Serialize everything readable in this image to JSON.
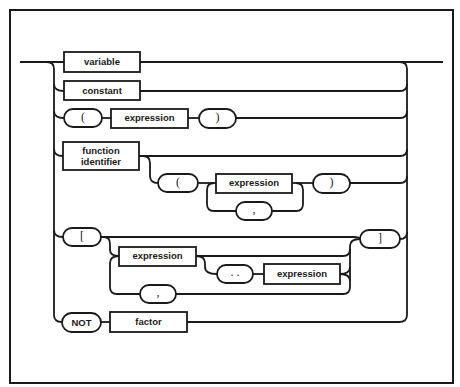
{
  "diagram": {
    "title": "factor",
    "type": "syntax-railroad-diagram",
    "colors": {
      "line": "#1a1a1a",
      "background": "#ffffff"
    },
    "nodes": {
      "variable": {
        "kind": "nonterminal",
        "label": "variable"
      },
      "constant": {
        "kind": "nonterminal",
        "label": "constant"
      },
      "lparen1": {
        "kind": "terminal",
        "label": "("
      },
      "expression1": {
        "kind": "nonterminal",
        "label": "expression"
      },
      "rparen1": {
        "kind": "terminal",
        "label": ")"
      },
      "function_identifier": {
        "kind": "nonterminal",
        "label_line1": "function",
        "label_line2": "identifier"
      },
      "lparen2": {
        "kind": "terminal",
        "label": "("
      },
      "expression2": {
        "kind": "nonterminal",
        "label": "expression"
      },
      "comma1": {
        "kind": "terminal",
        "label": ","
      },
      "rparen2": {
        "kind": "terminal",
        "label": ")"
      },
      "lbracket": {
        "kind": "terminal",
        "label": "["
      },
      "expression3": {
        "kind": "nonterminal",
        "label": "expression"
      },
      "comma2": {
        "kind": "terminal",
        "label": ","
      },
      "dotdot": {
        "kind": "terminal",
        "label": ". ."
      },
      "expression4": {
        "kind": "nonterminal",
        "label": "expression"
      },
      "rbracket": {
        "kind": "terminal",
        "label": "]"
      },
      "not": {
        "kind": "terminal",
        "label": "NOT"
      },
      "factor": {
        "kind": "nonterminal",
        "label": "factor"
      }
    },
    "alternatives": [
      [
        "variable"
      ],
      [
        "constant"
      ],
      [
        "lparen1",
        "expression1",
        "rparen1"
      ],
      [
        "function_identifier",
        "optional: lparen2 expression2 {comma1 expression2} rparen2"
      ],
      [
        "lbracket",
        "optional list: expression3 [dotdot expression4] {comma2 ...}",
        "rbracket"
      ],
      [
        "not",
        "factor"
      ]
    ]
  }
}
